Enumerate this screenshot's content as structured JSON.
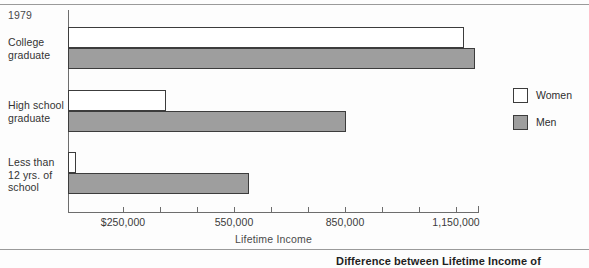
{
  "figure": {
    "year_label": "1979",
    "caption": "Difference between Lifetime Income of"
  },
  "legend": {
    "position": "right",
    "items": [
      {
        "label": "Women",
        "swatch": "white-square-icon",
        "color": "#ffffff"
      },
      {
        "label": "Men",
        "swatch": "gray-square-icon",
        "color": "#9e9e9e"
      }
    ]
  },
  "chart_data": {
    "type": "bar",
    "orientation": "horizontal",
    "title": "Difference between Lifetime Income of",
    "subtitle": "1979",
    "xlabel": "Lifetime Income",
    "ylabel": "",
    "categories": [
      "College graduate",
      "High school graduate",
      "Less than 12 yrs. of school"
    ],
    "series": [
      {
        "name": "Women",
        "color": "#ffffff",
        "values": [
          1173000,
          366000,
          122000
        ]
      },
      {
        "name": "Men",
        "color": "#9e9e9e",
        "values": [
          1203000,
          852000,
          589000
        ]
      }
    ],
    "xlim": [
      100000,
      1210000
    ],
    "x_tick_values": [
      100000,
      250000,
      350000,
      450000,
      550000,
      650000,
      750000,
      850000,
      950000,
      1050000,
      1150000
    ],
    "x_tick_labels": [
      "",
      "$250,000",
      "",
      "",
      "550,000",
      "",
      "",
      "850,000",
      "",
      "",
      "1,150,000"
    ],
    "labeled_ticks": [
      {
        "value": 250000,
        "label": "$250,000"
      },
      {
        "value": 550000,
        "label": "550,000"
      },
      {
        "value": 850000,
        "label": "850,000"
      },
      {
        "value": 1150000,
        "label": "1,150,000"
      }
    ],
    "grid": false,
    "legend_position": "right"
  },
  "category_labels": [
    "College\ngraduate",
    "High school\ngraduate",
    "Less than\n12 yrs. of\nschool"
  ],
  "axis": {
    "x_title": "Lifetime Income"
  }
}
